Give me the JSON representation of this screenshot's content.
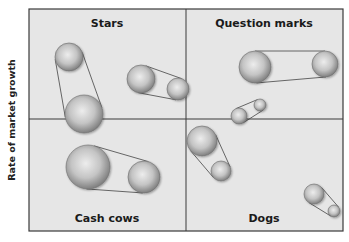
{
  "diagram": {
    "title": "",
    "y_axis_label": "Rate of market growth",
    "frame": {
      "x": 29,
      "y": 9,
      "width": 314,
      "height": 222,
      "divider_x": 186,
      "divider_y": 119
    },
    "colors": {
      "background": "#e6e6e6",
      "border": "#3a3a3a",
      "bubble_light": "#e4e4e4",
      "bubble_dark": "#8a8a8a",
      "line": "#444444"
    },
    "quadrants": [
      {
        "label": "Stars",
        "position": "top-left",
        "label_x": 107,
        "label_y": 27
      },
      {
        "label": "Question marks",
        "position": "top-right",
        "label_x": 264,
        "label_y": 27
      },
      {
        "label": "Cash cows",
        "position": "bottom-left",
        "label_x": 107,
        "label_y": 222
      },
      {
        "label": "Dogs",
        "position": "bottom-right",
        "label_x": 264,
        "label_y": 222
      }
    ],
    "bubble_pairs": [
      {
        "quadrant": "Stars",
        "a": {
          "cx": 69,
          "cy": 57,
          "r": 14
        },
        "b": {
          "cx": 84,
          "cy": 114,
          "r": 19
        }
      },
      {
        "quadrant": "Stars",
        "a": {
          "cx": 141,
          "cy": 79,
          "r": 14
        },
        "b": {
          "cx": 178,
          "cy": 89,
          "r": 11
        }
      },
      {
        "quadrant": "Question marks",
        "a": {
          "cx": 255,
          "cy": 67,
          "r": 16
        },
        "b": {
          "cx": 325,
          "cy": 64,
          "r": 13
        }
      },
      {
        "quadrant": "Question marks",
        "a": {
          "cx": 239,
          "cy": 116,
          "r": 8
        },
        "b": {
          "cx": 260,
          "cy": 105,
          "r": 6
        }
      },
      {
        "quadrant": "Dogs",
        "a": {
          "cx": 202,
          "cy": 141,
          "r": 15
        },
        "b": {
          "cx": 221,
          "cy": 171,
          "r": 10
        }
      },
      {
        "quadrant": "Dogs",
        "a": {
          "cx": 314,
          "cy": 194,
          "r": 10
        },
        "b": {
          "cx": 334,
          "cy": 211,
          "r": 6
        }
      },
      {
        "quadrant": "Cash cows",
        "a": {
          "cx": 88,
          "cy": 167,
          "r": 22
        },
        "b": {
          "cx": 144,
          "cy": 177,
          "r": 16
        }
      }
    ]
  }
}
